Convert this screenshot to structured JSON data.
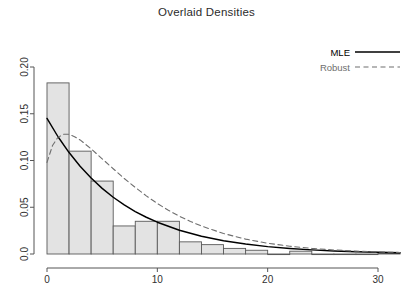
{
  "chart_data": {
    "type": "bar",
    "title": "Overlaid Densities",
    "xlabel": "",
    "ylabel": "",
    "xlim": [
      0,
      32.5
    ],
    "ylim": [
      0,
      0.215
    ],
    "grid": false,
    "xticks": [
      0,
      10,
      20,
      30
    ],
    "xtick_labels": [
      "0",
      "10",
      "20",
      "30"
    ],
    "yticks": [
      0.0,
      0.05,
      0.1,
      0.15,
      0.2
    ],
    "ytick_labels": [
      "0.0",
      "0.05",
      "0.10",
      "0.15",
      "0.20"
    ],
    "legend_position": "top-right",
    "histogram": {
      "name": "Histogram",
      "bin_width": 2,
      "bin_edges": [
        0,
        2,
        4,
        6,
        8,
        10,
        12,
        14,
        16,
        18,
        20,
        22,
        24,
        26,
        28,
        30,
        32
      ],
      "densities": [
        0.183,
        0.11,
        0.078,
        0.03,
        0.035,
        0.035,
        0.013,
        0.01,
        0.006,
        0.004,
        0.0,
        0.003,
        0.0,
        0.0,
        0.0,
        0.001
      ],
      "fill_color": "#e3e3e3",
      "border_color": "#595959"
    },
    "series": [
      {
        "name": "MLE",
        "type": "line",
        "style": "solid",
        "color": "#000000",
        "model": "exponential",
        "rate": 0.145,
        "x": [
          0,
          1,
          2,
          3,
          4,
          5,
          6,
          7,
          8,
          9,
          10,
          12,
          14,
          16,
          18,
          20,
          22,
          24,
          26,
          28,
          30,
          32
        ],
        "y": [
          0.145,
          0.1254,
          0.1085,
          0.0938,
          0.0812,
          0.0702,
          0.0607,
          0.0525,
          0.0454,
          0.0393,
          0.034,
          0.0254,
          0.019,
          0.0142,
          0.0106,
          0.0079,
          0.0059,
          0.0044,
          0.0033,
          0.0025,
          0.0019,
          0.0014
        ]
      },
      {
        "name": "Robust",
        "type": "line",
        "style": "dashed",
        "color": "#6e6e6e",
        "model": "gamma-like",
        "x": [
          0,
          0.5,
          1,
          1.5,
          2,
          2.5,
          3,
          4,
          5,
          6,
          7,
          8,
          9,
          10,
          11,
          12,
          13,
          14,
          16,
          18,
          20,
          22,
          24,
          26,
          28,
          30,
          32
        ],
        "y": [
          0.098,
          0.116,
          0.125,
          0.128,
          0.128,
          0.1255,
          0.122,
          0.1125,
          0.1018,
          0.0912,
          0.0808,
          0.0712,
          0.0622,
          0.054,
          0.0468,
          0.0404,
          0.0348,
          0.0299,
          0.0219,
          0.0159,
          0.0115,
          0.0083,
          0.006,
          0.0043,
          0.0031,
          0.0022,
          0.0016
        ]
      }
    ],
    "legend": [
      {
        "label": "MLE",
        "color": "#000000",
        "style": "solid"
      },
      {
        "label": "Robust",
        "color": "#6e6e6e",
        "style": "dashed"
      }
    ]
  }
}
